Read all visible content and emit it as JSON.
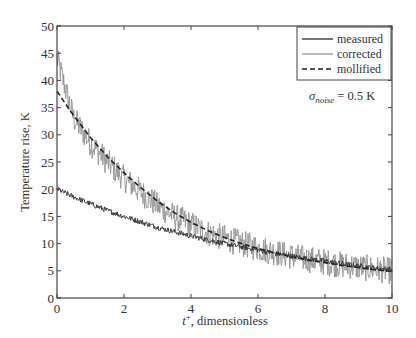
{
  "chart_data": {
    "type": "line",
    "title": "",
    "xlabel": "t+, dimensionless",
    "xlabel_base": "t",
    "xlabel_sup": "+",
    "xlabel_rest": ", dimensionless",
    "ylabel": "Temperature rise, K",
    "xlim": [
      0,
      10
    ],
    "ylim": [
      0,
      50
    ],
    "xticks": [
      0,
      2,
      4,
      6,
      8,
      10
    ],
    "yticks": [
      0,
      5,
      10,
      15,
      20,
      25,
      30,
      35,
      40,
      45,
      50
    ],
    "grid": false,
    "legend_position": "upper right",
    "x": [
      0,
      0.5,
      1,
      1.5,
      2,
      2.5,
      3,
      3.5,
      4,
      4.5,
      5,
      5.5,
      6,
      6.5,
      7,
      7.5,
      8,
      8.5,
      9,
      9.5,
      10
    ],
    "series": [
      {
        "name": "measured",
        "style": "solid",
        "color": "#3a3a3a",
        "noise_amplitude": 0.5,
        "values": [
          20.0,
          18.6,
          17.3,
          16.1,
          15.0,
          14.0,
          13.0,
          12.2,
          11.4,
          10.7,
          10.0,
          9.4,
          8.8,
          8.2,
          7.7,
          7.2,
          6.8,
          6.3,
          5.9,
          5.5,
          5.2
        ]
      },
      {
        "name": "corrected",
        "style": "solid",
        "color": "#9a9a9a",
        "noise_amplitude": 2.5,
        "values": [
          44.0,
          33.0,
          28.5,
          25.0,
          22.0,
          19.5,
          17.0,
          15.0,
          13.5,
          12.0,
          11.0,
          10.0,
          9.2,
          8.4,
          7.7,
          7.1,
          6.6,
          6.1,
          5.7,
          5.3,
          5.0
        ]
      },
      {
        "name": "mollified",
        "style": "dashed",
        "color": "#222222",
        "values": [
          38.0,
          33.5,
          29.5,
          26.0,
          23.0,
          20.3,
          17.8,
          15.7,
          13.9,
          12.4,
          11.1,
          10.0,
          9.1,
          8.3,
          7.6,
          7.0,
          6.5,
          6.0,
          5.6,
          5.2,
          4.9
        ]
      }
    ],
    "annotations": [
      {
        "text": "σnoise = 0.5 K",
        "symbol": "σ",
        "subscript": "noise",
        "rest": " = 0.5 K",
        "x": 7.4,
        "y": 40.5
      }
    ]
  },
  "legend": {
    "items": [
      {
        "label": "measured"
      },
      {
        "label": "corrected"
      },
      {
        "label": "mollified"
      }
    ]
  }
}
